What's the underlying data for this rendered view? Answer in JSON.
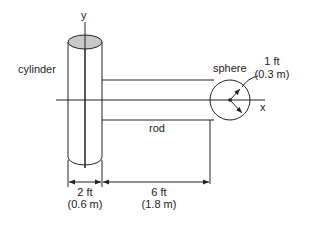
{
  "diagram": {
    "axis_y_label": "y",
    "axis_x_label": "x",
    "cylinder_label": "cylinder",
    "sphere_label": "sphere",
    "rod_label": "rod",
    "sphere_radius": {
      "imperial": "1 ft",
      "metric": "(0.3 m)"
    },
    "cylinder_width": {
      "imperial": "2 ft",
      "metric": "(0.6 m)"
    },
    "rod_length": {
      "imperial": "6 ft",
      "metric": "(1.8 m)"
    },
    "colors": {
      "line": "#222222",
      "cylinder_top_fill": "#c8c8c8",
      "background": "#ffffff"
    }
  }
}
